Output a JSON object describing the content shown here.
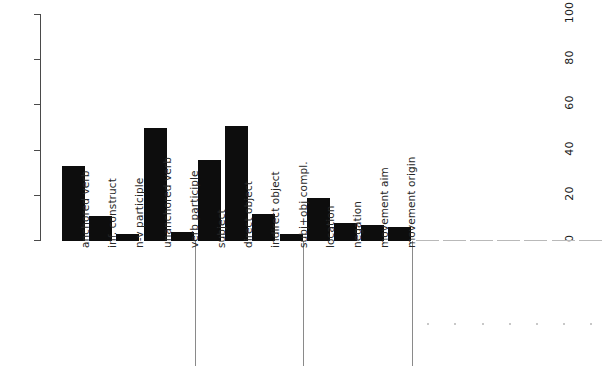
{
  "chart_data": {
    "type": "bar",
    "title": "",
    "subtitle": "",
    "xlabel": "",
    "ylabel": "",
    "ylim": [
      0,
      100
    ],
    "yticks": [
      0,
      20,
      40,
      60,
      80,
      100
    ],
    "grid": false,
    "legend": null,
    "bar_color": "#0d0d0d",
    "axis_color": "#4a4a4a",
    "separator_color": "#8a8a8a",
    "categories": [
      "anchored verb",
      "inf. construct",
      "n-v participle",
      "unanchored verb",
      "verb participle",
      "subject",
      "direct object",
      "indirect object",
      "subj+obj compl.",
      "location",
      "negation",
      "movement aim",
      "movement origin"
    ],
    "values": [
      33,
      11,
      3,
      50,
      4,
      36,
      51,
      12,
      3,
      19,
      8,
      7,
      6
    ],
    "groups": [
      {
        "name": "verbal forms",
        "start": 0,
        "end": 4
      },
      {
        "name": "arguments",
        "start": 5,
        "end": 8
      },
      {
        "name": "adjuncts",
        "start": 9,
        "end": 12
      }
    ],
    "empty_categories": 7
  },
  "axis": {
    "y_tick_labels": [
      "0",
      "20",
      "40",
      "60",
      "80",
      "100"
    ]
  }
}
